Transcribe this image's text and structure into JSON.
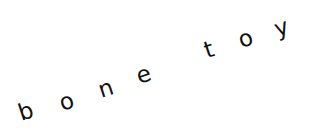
{
  "text": {
    "full": "bone toy",
    "words": [
      "bone",
      "toy"
    ],
    "letters": [
      "b",
      "o",
      "n",
      "e",
      "t",
      "o",
      "y"
    ]
  },
  "style": {
    "text_color": "#111111",
    "background": "#ffffff",
    "rotation_deg": -18
  }
}
